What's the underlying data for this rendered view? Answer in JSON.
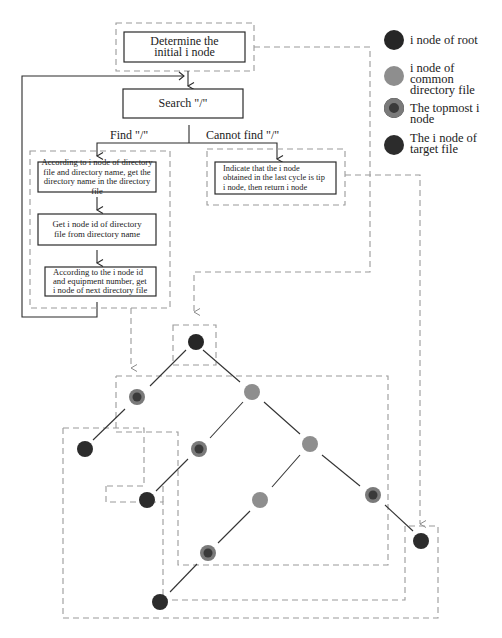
{
  "flowchart": {
    "determine_box": "Determine the initial i node",
    "search_box": "Search \"/\"",
    "find_label": "Find \"/\"",
    "cannot_find_label": "Cannot find \"/\"",
    "step1": "According to i node of directory file and directory name, get the directory name in the directory file",
    "step2": "Get i node id of directory file from directory name",
    "step3": "According to the i node id and equipment number, get i node of next directory file",
    "return_box": "Indicate that the i node obtained in the last cycle is tip i node, then return i node"
  },
  "legend": {
    "items": [
      {
        "label": "i node of root",
        "type": "root",
        "color": "#2a2a2a"
      },
      {
        "label": "i node of common directory file",
        "type": "common",
        "color": "#8c8c8c"
      },
      {
        "label": "The topmost i node",
        "type": "topmost",
        "color": "#6e6e6e"
      },
      {
        "label": "The i node of target file",
        "type": "target",
        "color": "#2e2e2e"
      }
    ]
  },
  "colors": {
    "root": "#262626",
    "common": "#8e8e8e",
    "topmost_outer": "#7a7a7a",
    "topmost_inner": "#3a3a3a",
    "target": "#2c2c2c",
    "dashed": "#9a9a9a",
    "solid": "#2a2a2a"
  }
}
